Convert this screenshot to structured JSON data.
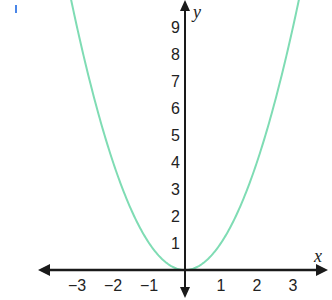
{
  "chart_data": {
    "type": "line",
    "title": "",
    "function": "y = x^2",
    "xlabel": "x",
    "ylabel": "y",
    "xlim": [
      -4,
      4
    ],
    "ylim": [
      0,
      10
    ],
    "x_ticks": [
      -3,
      -2,
      -1,
      1,
      2,
      3
    ],
    "x_tick_labels": [
      "−3",
      "−2",
      "−1",
      "1",
      "2",
      "3"
    ],
    "y_ticks": [
      1,
      2,
      3,
      4,
      5,
      6,
      7,
      8,
      9
    ],
    "y_tick_labels": [
      "1",
      "2",
      "3",
      "4",
      "5",
      "6",
      "7",
      "8",
      "9"
    ],
    "grid": false,
    "series": [
      {
        "name": "y = x^2",
        "color": "#7fdcb4",
        "x": [
          -3.2,
          -3,
          -2.5,
          -2,
          -1.5,
          -1,
          -0.5,
          0,
          0.5,
          1,
          1.5,
          2,
          2.5,
          3,
          3.2
        ],
        "y": [
          10.24,
          9,
          6.25,
          4,
          2.25,
          1,
          0.25,
          0,
          0.25,
          1,
          2.25,
          4,
          6.25,
          9,
          10.24
        ]
      }
    ]
  },
  "colors": {
    "axis": "#1a1a1a",
    "curve": "#7fdcb4",
    "marker": "#4a86e8"
  }
}
